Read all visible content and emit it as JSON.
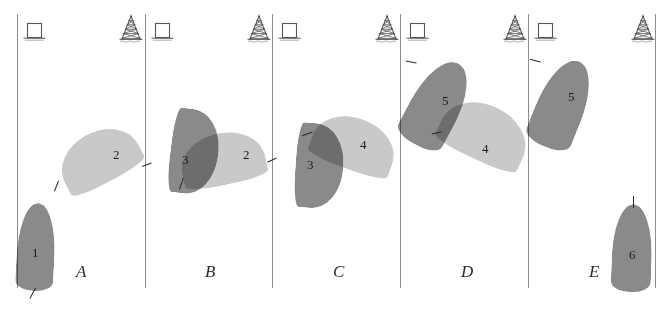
{
  "figure": {
    "width": 672,
    "height": 311,
    "background": "#ffffff",
    "divider_color": "#8d8d8d"
  },
  "colors": {
    "vessel_dark": "#8a8a8a",
    "vessel_light": "#c9c9c9",
    "vessel_overlap": "#7a7a7a",
    "ink": "#2b2b2b",
    "line": "#8d8d8d"
  },
  "icons": {
    "dock": {
      "name": "dock-icon",
      "label": "port"
    },
    "tower": {
      "name": "derrick-tower-icon",
      "label": "derrick"
    }
  },
  "panels": [
    {
      "id": "A",
      "letter": "A",
      "letter_x": 76,
      "letter_y": 262,
      "left_edge": 17,
      "right_edge": 145,
      "dock_x": 22,
      "tower_x": 118,
      "vessels": [
        {
          "id": "v1",
          "number": "1",
          "shade": "dark",
          "x": 17,
          "y": 203,
          "w": 38,
          "h": 88,
          "rotation": 3,
          "label_x": 32,
          "label_y": 246,
          "mast": {
            "x": 35,
            "y": 288,
            "w": 1,
            "h": 12,
            "rot": 28
          }
        },
        {
          "id": "v2",
          "number": "2",
          "shade": "light",
          "x": 57,
          "y": 132,
          "w": 83,
          "h": 52,
          "rotation": -28,
          "label_x": 113,
          "label_y": 148,
          "mast": {
            "x": 58,
            "y": 181,
            "w": 1,
            "h": 11,
            "rot": 22
          }
        }
      ]
    },
    {
      "id": "B",
      "letter": "B",
      "letter_x": 205,
      "letter_y": 262,
      "left_edge": 145,
      "right_edge": 272,
      "dock_x": 150,
      "tower_x": 246,
      "vessels": [
        {
          "id": "v2b",
          "number": "2",
          "shade": "light",
          "x": 180,
          "y": 133,
          "w": 85,
          "h": 52,
          "rotation": -12,
          "label_x": 243,
          "label_y": 148,
          "mast": {
            "x": 183,
            "y": 178,
            "w": 1,
            "h": 12,
            "rot": 20
          }
        },
        {
          "id": "v3b",
          "number": "3",
          "shade": "dark",
          "x": 152,
          "y": 128,
          "w": 85,
          "h": 48,
          "rotation": 97,
          "label_x": 182,
          "label_y": 153,
          "mast": {
            "x": 151,
            "y": 163,
            "w": 1,
            "h": 10,
            "rot": 70
          }
        }
      ]
    },
    {
      "id": "C",
      "letter": "C",
      "letter_x": 333,
      "letter_y": 262,
      "left_edge": 272,
      "right_edge": 400,
      "dock_x": 277,
      "tower_x": 374,
      "vessels": [
        {
          "id": "v4c",
          "number": "4",
          "shade": "light",
          "x": 312,
          "y": 118,
          "w": 85,
          "h": 52,
          "rotation": 20,
          "label_x": 360,
          "label_y": 138,
          "mast": {
            "x": 312,
            "y": 132,
            "w": 1,
            "h": 11,
            "rot": 70
          }
        },
        {
          "id": "v3c",
          "number": "3",
          "shade": "dark",
          "x": 277,
          "y": 142,
          "w": 85,
          "h": 48,
          "rotation": 94,
          "label_x": 307,
          "label_y": 158,
          "mast": {
            "x": 276,
            "y": 158,
            "w": 1,
            "h": 10,
            "rot": 65
          }
        }
      ]
    },
    {
      "id": "D",
      "letter": "D",
      "letter_x": 461,
      "letter_y": 262,
      "left_edge": 400,
      "right_edge": 528,
      "dock_x": 405,
      "tower_x": 502,
      "vessels": [
        {
          "id": "v4d",
          "number": "4",
          "shade": "light",
          "x": 440,
          "y": 105,
          "w": 90,
          "h": 56,
          "rotation": 25,
          "label_x": 482,
          "label_y": 142,
          "mast": {
            "x": 441,
            "y": 132,
            "w": 1,
            "h": 10,
            "rot": 78
          }
        },
        {
          "id": "v5d",
          "number": "5",
          "shade": "dark",
          "x": 412,
          "y": 58,
          "w": 50,
          "h": 92,
          "rotation": 28,
          "label_x": 442,
          "label_y": 94,
          "mast": {
            "x": 416,
            "y": 63,
            "w": 1,
            "h": 11,
            "rot": 100
          }
        }
      ]
    },
    {
      "id": "E",
      "letter": "E",
      "letter_x": 589,
      "letter_y": 262,
      "left_edge": 528,
      "right_edge": 655,
      "dock_x": 533,
      "tower_x": 630,
      "vessels": [
        {
          "id": "v5e",
          "number": "5",
          "shade": "dark",
          "x": 538,
          "y": 58,
          "w": 48,
          "h": 92,
          "rotation": 22,
          "label_x": 568,
          "label_y": 90,
          "mast": {
            "x": 540,
            "y": 62,
            "w": 1,
            "h": 11,
            "rot": 105
          }
        },
        {
          "id": "v6e",
          "number": "6",
          "shade": "dark",
          "x": 612,
          "y": 204,
          "w": 40,
          "h": 88,
          "rotation": 2,
          "label_x": 629,
          "label_y": 248,
          "mast": {
            "x": 633,
            "y": 196,
            "w": 1,
            "h": 12,
            "rot": 0
          }
        }
      ]
    }
  ]
}
